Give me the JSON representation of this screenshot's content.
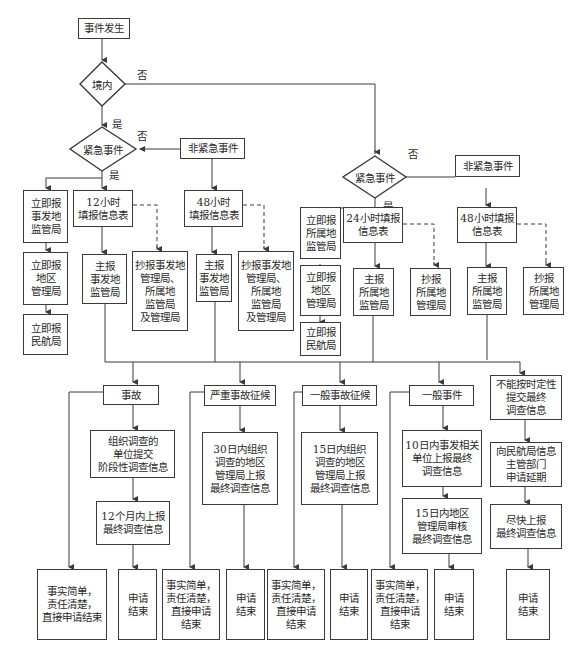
{
  "diagram": {
    "type": "flowchart",
    "start": "事件发生",
    "decision_domestic": {
      "label": "境内",
      "yes": "是",
      "no": "否"
    },
    "left_branch": {
      "decision": {
        "label": "紧急事件",
        "yes": "是",
        "no": "否"
      },
      "non_urgent": "非紧急事件",
      "urgent_chain": [
        "立即报\n事发地\n监管局",
        "立即报\n地区\n管理局",
        "立即报\n民航局"
      ],
      "form_12h": "12小时\n填报信息表",
      "main_12h": "主报\n事发地\n监管局",
      "copy_12h": "抄报事发地\n管理局、\n所属地\n监管局\n及管理局",
      "form_48h": "48小时\n填报信息表",
      "main_48h": "主报\n事发地\n监管局",
      "copy_48h": "抄报事发地\n管理局、\n所属地\n监管局\n及管理局"
    },
    "right_branch": {
      "decision": {
        "label": "紧急事件",
        "yes": "是",
        "no": "否"
      },
      "non_urgent": "非紧急事件",
      "urgent_chain": [
        "立即报\n所属地\n监管局",
        "立即报\n地区\n管理局",
        "立即报\n民航局"
      ],
      "form_24h": "24小时填报\n信息表",
      "main_24h": "主报\n所属地\n监管局",
      "copy_24h": "抄报\n所属地\n管理局",
      "form_48h": "48小时填报\n信息表",
      "main_48h": "主报\n所属地\n监管局",
      "copy_48h": "抄报\n所属地\n管理局"
    },
    "categories": [
      {
        "label": "事故",
        "steps": [
          "组织调查的\n单位提交\n阶段性调查信息",
          "12个月内上报\n最终调查信息"
        ],
        "simple_end": "事实简单，\n责任清楚，\n直接申请结束",
        "end": "申请\n结束"
      },
      {
        "label": "严重事故征候",
        "steps": [
          "30日内组织\n调查的地区\n管理局上报\n最终调查信息"
        ],
        "simple_end": "事实简单，\n责任清楚，\n直接申请\n结束",
        "end": "申请\n结束"
      },
      {
        "label": "一般事故征候",
        "steps": [
          "15日内组织\n调查的地区\n管理局上报\n最终调查信息"
        ],
        "simple_end": "事实简单，\n责任清楚，\n直接申请\n结束",
        "end": "申请\n结束"
      },
      {
        "label": "一般事件",
        "steps": [
          "10日内事发相关\n单位上报最终\n调查信息",
          "15日内地区\n管理局审核\n最终调查信息"
        ],
        "simple_end": "事实简单，\n责任清楚，\n直接申请\n结束",
        "end": "申请\n结束"
      },
      {
        "label": "不能按时定性\n提交最终\n调查信息",
        "steps": [
          "向民航局信息\n主管部门\n申请延期",
          "尽快上报\n最终调查信息"
        ],
        "end": "申请\n结束"
      }
    ]
  },
  "colors": {
    "line": "#3a3a3a",
    "background": "#ffffff"
  }
}
